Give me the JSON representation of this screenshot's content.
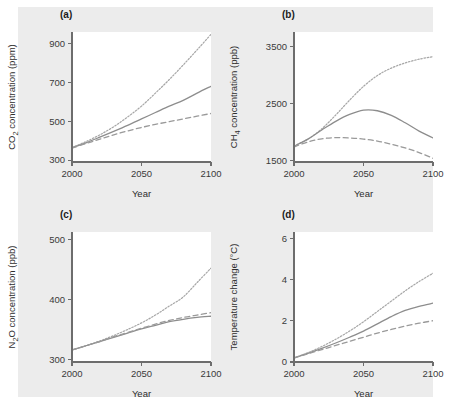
{
  "figure": {
    "background_color": "#ececec",
    "plot_background_color": "#ffffff",
    "line_color": "#8d8d8d"
  },
  "panels": [
    {
      "key": "a",
      "label": "(a)",
      "xlabel": "Year",
      "ylabel": "CO2 concentration (ppm)",
      "ylabel_parts": {
        "pre": "CO",
        "sub": "2",
        "post": " concentration (ppm)"
      }
    },
    {
      "key": "b",
      "label": "(b)",
      "xlabel": "Year",
      "ylabel": "CH4 concentration (ppb)",
      "ylabel_parts": {
        "pre": "CH",
        "sub": "4",
        "post": " concentration (ppb)"
      }
    },
    {
      "key": "c",
      "label": "(c)",
      "xlabel": "Year",
      "ylabel": "N2O concentration (ppb)",
      "ylabel_parts": {
        "pre": "N",
        "sub": "2",
        "post": "O concentration (ppb)"
      }
    },
    {
      "key": "d",
      "label": "(d)",
      "xlabel": "Year",
      "ylabel": "Temperature change (°C)",
      "ylabel_parts": {
        "pre": "Temperature change (",
        "sub": "",
        "post": "°C)"
      }
    }
  ],
  "chart_data": [
    {
      "type": "line",
      "panel": "a",
      "title": "(a)",
      "xlabel": "Year",
      "ylabel": "CO2 concentration (ppm)",
      "xlim": [
        2000,
        2100
      ],
      "ylim": [
        290,
        960
      ],
      "xticks": [
        2000,
        2050,
        2100
      ],
      "xtick_labels": [
        "2000",
        "2050",
        "2100"
      ],
      "yticks": [
        300,
        500,
        700,
        900
      ],
      "ytick_labels": [
        "300",
        "500",
        "700",
        "900"
      ],
      "grid": false,
      "legend": "none",
      "x": [
        2000,
        2010,
        2020,
        2030,
        2040,
        2050,
        2060,
        2070,
        2080,
        2090,
        2100
      ],
      "series": [
        {
          "name": "high-scenario",
          "style": "dotted",
          "values": [
            365,
            395,
            430,
            472,
            522,
            578,
            645,
            715,
            790,
            868,
            948
          ]
        },
        {
          "name": "mid-scenario",
          "style": "solid",
          "values": [
            363,
            389,
            418,
            448,
            479,
            512,
            545,
            578,
            608,
            645,
            680
          ]
        },
        {
          "name": "low-scenario",
          "style": "dashed",
          "values": [
            362,
            385,
            408,
            430,
            450,
            468,
            484,
            498,
            512,
            526,
            540
          ]
        }
      ]
    },
    {
      "type": "line",
      "panel": "b",
      "title": "(b)",
      "xlabel": "Year",
      "ylabel": "CH4 concentration (ppb)",
      "xlim": [
        2000,
        2100
      ],
      "ylim": [
        1480,
        3750
      ],
      "xticks": [
        2000,
        2050,
        2100
      ],
      "xtick_labels": [
        "2000",
        "2050",
        "2100"
      ],
      "yticks": [
        1500,
        2500,
        3500
      ],
      "ytick_labels": [
        "1500",
        "2500",
        "3500"
      ],
      "grid": false,
      "legend": "none",
      "x": [
        2000,
        2010,
        2020,
        2030,
        2040,
        2050,
        2060,
        2070,
        2080,
        2090,
        2100
      ],
      "series": [
        {
          "name": "high-scenario",
          "style": "dotted",
          "values": [
            1760,
            1880,
            2060,
            2300,
            2560,
            2800,
            2990,
            3120,
            3210,
            3275,
            3320
          ]
        },
        {
          "name": "mid-scenario",
          "style": "solid",
          "values": [
            1755,
            1880,
            2040,
            2190,
            2310,
            2385,
            2375,
            2295,
            2165,
            2020,
            1900
          ]
        },
        {
          "name": "low-scenario",
          "style": "dashed",
          "values": [
            1745,
            1830,
            1885,
            1905,
            1900,
            1880,
            1845,
            1790,
            1725,
            1645,
            1545
          ]
        }
      ]
    },
    {
      "type": "line",
      "panel": "c",
      "title": "(c)",
      "xlabel": "Year",
      "ylabel": "N2O concentration (ppb)",
      "xlim": [
        2000,
        2100
      ],
      "ylim": [
        296,
        512
      ],
      "xticks": [
        2000,
        2050,
        2100
      ],
      "xtick_labels": [
        "2000",
        "2050",
        "2100"
      ],
      "yticks": [
        300,
        400,
        500
      ],
      "ytick_labels": [
        "300",
        "400",
        "500"
      ],
      "grid": false,
      "legend": "none",
      "x": [
        2000,
        2010,
        2020,
        2030,
        2040,
        2050,
        2060,
        2070,
        2080,
        2090,
        2100
      ],
      "series": [
        {
          "name": "high-scenario",
          "style": "dotted",
          "values": [
            316,
            323,
            331,
            340,
            350,
            361,
            374,
            389,
            404,
            428,
            452
          ]
        },
        {
          "name": "mid-scenario",
          "style": "solid",
          "values": [
            316,
            323,
            330,
            337,
            344,
            351,
            357,
            363,
            367,
            370,
            372
          ]
        },
        {
          "name": "low-scenario",
          "style": "dashed",
          "values": [
            316,
            323,
            330,
            338,
            345,
            352,
            359,
            365,
            370,
            374,
            378
          ]
        }
      ]
    },
    {
      "type": "line",
      "panel": "d",
      "title": "(d)",
      "xlabel": "Year",
      "ylabel": "Temperature change (°C)",
      "xlim": [
        2000,
        2100
      ],
      "ylim": [
        0,
        6.3
      ],
      "xticks": [
        2000,
        2050,
        2100
      ],
      "xtick_labels": [
        "2000",
        "2050",
        "2100"
      ],
      "yticks": [
        0,
        2,
        4,
        6
      ],
      "ytick_labels": [
        "0",
        "2",
        "4",
        "6"
      ],
      "grid": false,
      "legend": "none",
      "x": [
        2000,
        2010,
        2020,
        2030,
        2040,
        2050,
        2060,
        2070,
        2080,
        2090,
        2100
      ],
      "series": [
        {
          "name": "high-scenario",
          "style": "dotted",
          "values": [
            0.2,
            0.45,
            0.75,
            1.1,
            1.5,
            1.95,
            2.45,
            2.95,
            3.45,
            3.9,
            4.3
          ]
        },
        {
          "name": "mid-scenario",
          "style": "solid",
          "values": [
            0.2,
            0.42,
            0.66,
            0.92,
            1.2,
            1.5,
            1.85,
            2.2,
            2.5,
            2.7,
            2.85
          ]
        },
        {
          "name": "low-scenario",
          "style": "dashed",
          "values": [
            0.2,
            0.4,
            0.6,
            0.8,
            1.0,
            1.2,
            1.4,
            1.58,
            1.74,
            1.88,
            2.0
          ]
        }
      ]
    }
  ]
}
